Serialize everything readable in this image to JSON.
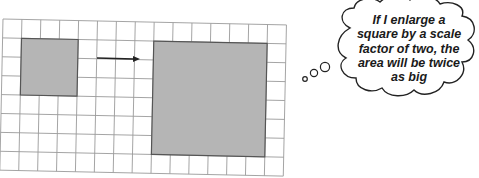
{
  "grid": {
    "columns": 15,
    "rows": 8,
    "cell_size": 18.9,
    "origin": [
      3,
      19
    ],
    "rotation_deg": 1.2,
    "line_color": "#9a9a9a",
    "border_color": "#8a8a8a"
  },
  "shapes": {
    "small_square": {
      "col": 1,
      "row": 1,
      "size_cells": 3,
      "fill": "#b5b5b5",
      "stroke": "#555555"
    },
    "large_square": {
      "col": 8,
      "row": 1,
      "size_cells": 6,
      "fill": "#b5b5b5",
      "stroke": "#555555"
    },
    "arrow": {
      "from": [
        97,
        58
      ],
      "to": [
        140,
        59
      ],
      "color": "#222222"
    }
  },
  "thought_bubble": {
    "lines": [
      "If I enlarge a",
      "square by a scale",
      "factor of two, the",
      "area will be twice",
      "as big"
    ],
    "stroke": "#222222",
    "trail_circles": [
      {
        "cx": 305,
        "cy": 79,
        "r": 2.3
      },
      {
        "cx": 314,
        "cy": 73,
        "r": 3.6
      },
      {
        "cx": 325,
        "cy": 67,
        "r": 4.6
      }
    ]
  }
}
